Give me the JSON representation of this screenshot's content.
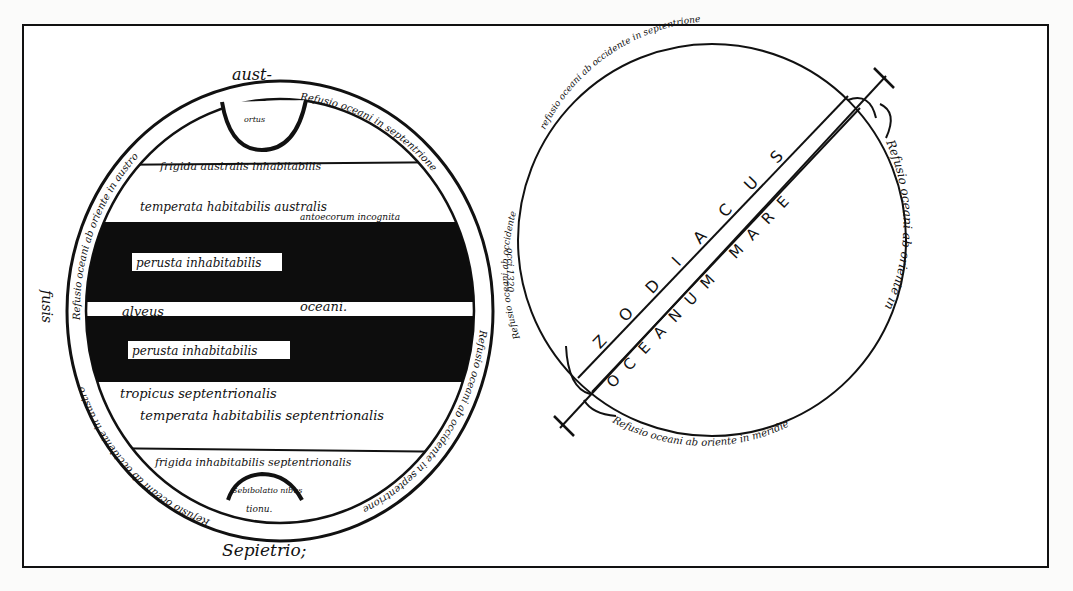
{
  "figure": {
    "colors": {
      "ink": "#111111",
      "paper": "#fbfbfa"
    }
  },
  "left_map": {
    "top_label": "aust-",
    "bottom_label": "Sepietrio;",
    "left_side_label": "fusis",
    "top_bay_label": "ortus",
    "bottom_bay_label": "Sebibolatio nibus",
    "bottom_bay_sublabel": "tionu.",
    "zones": [
      {
        "label": "frigida australis inhabitabilis",
        "fill": "white"
      },
      {
        "label": "temperata habitabilis australis",
        "sublabel": "antoecorum incognita",
        "fill": "white"
      },
      {
        "label": "perusta inhabitabilis",
        "fill": "black"
      },
      {
        "label": "alveus",
        "label2": "oceani.",
        "fill": "white"
      },
      {
        "label": "perusta inhabitabilis",
        "fill": "black"
      },
      {
        "label": "tropicus septentrionalis",
        "label2": "temperata habitabilis septentrionalis",
        "fill": "white"
      },
      {
        "label": "frigida inhabitabilis septentrionalis",
        "fill": "white"
      }
    ],
    "rim_texts": [
      "Refusio oceani ab oriente in austro",
      "Refusio oceani in septentrione",
      "Refusio oceani ab occidente in septentrione",
      "Refusio oceani ab occidente in austro"
    ]
  },
  "right_map": {
    "band_upper_label": "ZODIACUS",
    "band_upper_letters": [
      "Z",
      "O",
      "D",
      "I",
      "A",
      "C",
      "U",
      "S"
    ],
    "band_lower_label": "OCEANUM MARE",
    "band_lower_letters": [
      "O",
      "C",
      "E",
      "A",
      "N",
      "U",
      "M",
      "MARE"
    ],
    "rim_texts": {
      "top": "refusio oceani ab occidente in septentrione",
      "right": "Refusio oceani ab oriente in",
      "bottom": "Refusio oceani ab oriente in meridie",
      "left": "Refusio oceani ab occidente"
    },
    "between_label": "occi.1320"
  }
}
